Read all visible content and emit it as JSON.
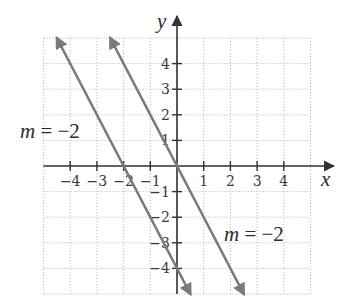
{
  "chart_data": {
    "type": "line",
    "title": "",
    "xlabel": "x",
    "ylabel": "y",
    "xlim": [
      -5,
      5
    ],
    "ylim": [
      -5,
      5
    ],
    "grid": true,
    "x_ticks": [
      -4,
      -3,
      -2,
      -1,
      1,
      2,
      3,
      4
    ],
    "x_tick_labels": [
      "−4",
      "−3",
      "−2",
      "−1",
      "1",
      "2",
      "3",
      "4"
    ],
    "y_ticks": [
      4,
      3,
      2,
      1,
      -1,
      -2,
      -3,
      -4
    ],
    "y_tick_labels": [
      "4",
      "3",
      "2",
      "1",
      "−1",
      "−2",
      "−3",
      "−4"
    ],
    "series": [
      {
        "name": "m = −2 (left line)",
        "equation": "y = -2x - 4",
        "slope": -2,
        "y_intercept": -4,
        "x": [
          -4.5,
          0.5
        ],
        "y": [
          5,
          -5
        ],
        "arrows": "both"
      },
      {
        "name": "m = −2 (right line)",
        "equation": "y = -2x",
        "slope": -2,
        "y_intercept": 0,
        "x": [
          -2.5,
          2.5
        ],
        "y": [
          5,
          -5
        ],
        "arrows": "both"
      }
    ],
    "annotations": [
      {
        "text": "m = −2",
        "x": -6.2,
        "y": 1.6,
        "refers_to": "left line"
      },
      {
        "text": "m = −2",
        "x": 1.5,
        "y": -2.4,
        "refers_to": "right line"
      }
    ]
  },
  "labels": {
    "x_axis": "x",
    "y_axis": "y",
    "annot_left_m": "m",
    "annot_left_rest": " = −2",
    "annot_right_m": "m",
    "annot_right_rest": " = −2"
  },
  "colors": {
    "line": "#7a7a7a",
    "axis": "#333333",
    "grid": "#bdbdbd"
  }
}
